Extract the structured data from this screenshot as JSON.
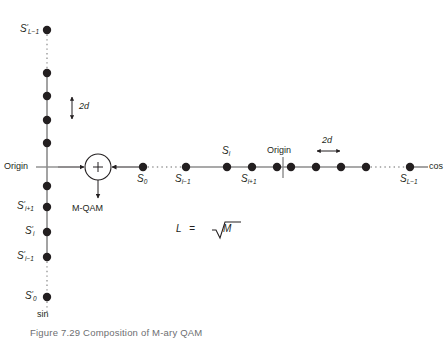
{
  "figure": {
    "domain": "Diagram",
    "colors": {
      "line": "#8c8c8c",
      "dot": "#231f20",
      "text": "#231f20",
      "caption": "#6d6e71",
      "background": "#ffffff"
    },
    "caption": "Figure 7.29   Composition of M-ary QAM"
  },
  "vertical_axis": {
    "name": "sin-axis",
    "axis_label": "sin",
    "origin_label": "Origin",
    "spacing_label": "2d",
    "labels": {
      "top": {
        "base": "S",
        "prime": "′",
        "sub": "L−1"
      },
      "i_plus_1": {
        "base": "S",
        "prime": "′",
        "sub": "i+1"
      },
      "i": {
        "base": "S",
        "prime": "′",
        "sub": "i"
      },
      "i_minus_1": {
        "base": "S",
        "prime": "′",
        "sub": "i−1"
      },
      "bottom": {
        "base": "S",
        "prime": "′",
        "sub": "0"
      }
    },
    "points_y": [
      30,
      73,
      96,
      120,
      143,
      186,
      207,
      232,
      257,
      297
    ],
    "origin_y": 167,
    "dotted_segments": [
      [
        30,
        73
      ],
      [
        257,
        297
      ]
    ]
  },
  "horizontal_axis": {
    "name": "cos-axis",
    "axis_label": "cos",
    "origin_label": "Origin",
    "spacing_label": "2d",
    "labels": {
      "start": {
        "base": "S",
        "sub": "0"
      },
      "i_minus_1": {
        "base": "S",
        "sub": "i−1"
      },
      "i": {
        "base": "S",
        "sub": "i"
      },
      "i_plus_1": {
        "base": "S",
        "sub": "i+1"
      },
      "end": {
        "base": "S",
        "sub": "L−1"
      }
    },
    "points_x": [
      143,
      186,
      227,
      252,
      277,
      291,
      316,
      341,
      366,
      410
    ],
    "origin_x": 283,
    "dotted_segments": [
      [
        143,
        186
      ],
      [
        366,
        410
      ]
    ]
  },
  "summer": {
    "name": "summing-junction",
    "symbol": "+",
    "output_label": "M-QAM"
  },
  "formula": {
    "text": "L = √M",
    "lhs": "L",
    "relation": "=",
    "rhs_radicand": "M"
  }
}
